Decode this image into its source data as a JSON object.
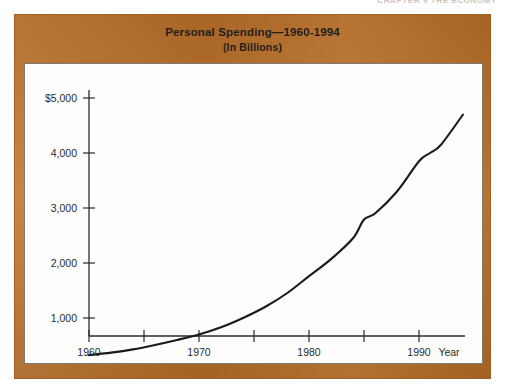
{
  "running_head": {
    "text": "CHAPTER 9   THE ECONOMY",
    "page_number": "223"
  },
  "figure": {
    "title_line1": "Personal Spending—1960-1994",
    "title_line2": "(In Billions)",
    "frame_color": "#c0732a",
    "panel_color": "#fdfdfb",
    "curve_color": "#1a1a1a"
  },
  "chart_data": {
    "type": "line",
    "title": "Personal Spending—1960-1994",
    "subtitle": "(In Billions)",
    "xlabel": "Year",
    "ylabel": "",
    "xlim": [
      1960,
      1995
    ],
    "ylim": [
      0,
      5000
    ],
    "grid": false,
    "legend": null,
    "y_tick_labels": [
      "$5,000",
      "4,000",
      "3,000",
      "2,000",
      "1,000"
    ],
    "y_ticks": [
      5000,
      4000,
      3000,
      2000,
      1000
    ],
    "x_ticks": [
      1960,
      1965,
      1970,
      1975,
      1980,
      1985,
      1990
    ],
    "x_tick_labels": [
      "1960",
      "",
      "1970",
      "",
      "1980",
      "",
      "1990"
    ],
    "series": [
      {
        "name": "Personal Spending",
        "x": [
          1960,
          1962,
          1964,
          1966,
          1968,
          1970,
          1972,
          1974,
          1976,
          1978,
          1980,
          1982,
          1984,
          1985,
          1986,
          1988,
          1990,
          1991,
          1992,
          1994
        ],
        "values": [
          325,
          370,
          430,
          510,
          600,
          700,
          830,
          1000,
          1200,
          1450,
          1760,
          2070,
          2450,
          2790,
          2900,
          3300,
          3850,
          4000,
          4150,
          4700
        ]
      }
    ]
  },
  "axis_geometry": {
    "x_pixels": {
      "1960": 64,
      "1965": 119,
      "1970": 174,
      "1975": 229,
      "1980": 284,
      "1985": 339,
      "1990": 394
    },
    "y_pixels": {
      "1000": 254,
      "2000": 199,
      "3000": 144,
      "4000": 89,
      "5000": 34
    }
  }
}
